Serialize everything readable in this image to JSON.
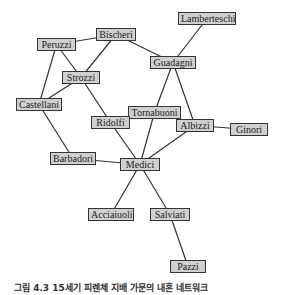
{
  "figure": {
    "caption": "그림 4.3  15세기 피렌체 지배 가문의 내혼 네트워크",
    "edge_color": "#333333",
    "node_fill": "#d0d0d0",
    "node_border": "#333333"
  },
  "nodes": [
    {
      "id": "lamberteschi",
      "label": "Lamberteschi",
      "x": 178,
      "y": 12,
      "w": 58,
      "h": 13
    },
    {
      "id": "peruzzi",
      "label": "Peruzzi",
      "x": 37,
      "y": 38,
      "w": 39,
      "h": 13
    },
    {
      "id": "bischeri",
      "label": "Bischeri",
      "x": 96,
      "y": 28,
      "w": 40,
      "h": 13
    },
    {
      "id": "guadagni",
      "label": "Guadagni",
      "x": 150,
      "y": 56,
      "w": 46,
      "h": 13
    },
    {
      "id": "strozzi",
      "label": "Strozzi",
      "x": 62,
      "y": 71,
      "w": 38,
      "h": 13
    },
    {
      "id": "castellani",
      "label": "Castellani",
      "x": 16,
      "y": 98,
      "w": 46,
      "h": 13
    },
    {
      "id": "tornabuoni",
      "label": "Tornabuoni",
      "x": 128,
      "y": 106,
      "w": 53,
      "h": 13
    },
    {
      "id": "ridolfi",
      "label": "Ridolfi",
      "x": 91,
      "y": 116,
      "w": 39,
      "h": 13
    },
    {
      "id": "albizzi",
      "label": "Albizzi",
      "x": 176,
      "y": 119,
      "w": 38,
      "h": 13
    },
    {
      "id": "ginori",
      "label": "Ginori",
      "x": 230,
      "y": 123,
      "w": 38,
      "h": 13
    },
    {
      "id": "barbadori",
      "label": "Barbadori",
      "x": 50,
      "y": 152,
      "w": 46,
      "h": 13
    },
    {
      "id": "medici",
      "label": "Medici",
      "x": 120,
      "y": 158,
      "w": 40,
      "h": 13
    },
    {
      "id": "acciaiuoli",
      "label": "Acciaiuoli",
      "x": 88,
      "y": 208,
      "w": 46,
      "h": 13
    },
    {
      "id": "salviati",
      "label": "Salviati",
      "x": 150,
      "y": 208,
      "w": 40,
      "h": 13
    },
    {
      "id": "pazzi",
      "label": "Pazzi",
      "x": 170,
      "y": 260,
      "w": 36,
      "h": 13
    }
  ],
  "edges": [
    [
      "peruzzi",
      "bischeri"
    ],
    [
      "peruzzi",
      "strozzi"
    ],
    [
      "peruzzi",
      "castellani"
    ],
    [
      "bischeri",
      "strozzi"
    ],
    [
      "bischeri",
      "guadagni"
    ],
    [
      "lamberteschi",
      "guadagni"
    ],
    [
      "strozzi",
      "castellani"
    ],
    [
      "strozzi",
      "ridolfi"
    ],
    [
      "guadagni",
      "tornabuoni"
    ],
    [
      "guadagni",
      "albizzi"
    ],
    [
      "castellani",
      "barbadori"
    ],
    [
      "ridolfi",
      "medici"
    ],
    [
      "ridolfi",
      "tornabuoni"
    ],
    [
      "tornabuoni",
      "medici"
    ],
    [
      "albizzi",
      "medici"
    ],
    [
      "albizzi",
      "ginori"
    ],
    [
      "barbadori",
      "medici"
    ],
    [
      "medici",
      "acciaiuoli"
    ],
    [
      "medici",
      "salviati"
    ],
    [
      "salviati",
      "pazzi"
    ]
  ]
}
